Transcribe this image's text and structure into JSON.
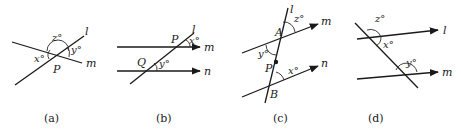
{
  "figures": [
    {
      "id": "a",
      "caption": "(a)",
      "lines": [
        "l",
        "m"
      ],
      "point": "P",
      "angles": {
        "z": "z°",
        "y": "y°",
        "x": "x°"
      },
      "line_labels": {
        "l": "l",
        "m": "m"
      }
    },
    {
      "id": "b",
      "caption": "(b)",
      "lines": [
        "l",
        "m",
        "n"
      ],
      "points": {
        "P": "P",
        "Q": "Q"
      },
      "angles": {
        "x": "x°",
        "y": "y°"
      },
      "line_labels": {
        "l": "l",
        "m": "m",
        "n": "n"
      }
    },
    {
      "id": "c",
      "caption": "(c)",
      "lines": [
        "l",
        "m",
        "n"
      ],
      "points": {
        "A": "A",
        "P": "P",
        "B": "B"
      },
      "angles": {
        "z": "z°",
        "y": "y°",
        "x": "x°"
      },
      "line_labels": {
        "l": "l",
        "m": "m",
        "n": "n"
      }
    },
    {
      "id": "d",
      "caption": "(d)",
      "lines": [
        "l",
        "m"
      ],
      "angles": {
        "z": "z°",
        "x": "x°",
        "y": "y°"
      },
      "line_labels": {
        "l": "l",
        "m": "m"
      }
    }
  ]
}
